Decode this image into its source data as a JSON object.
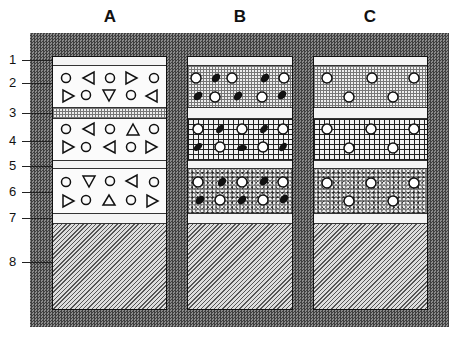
{
  "diagram": {
    "columns": [
      {
        "label": "A",
        "x": 52,
        "width": 115
      },
      {
        "label": "B",
        "x": 187,
        "width": 106
      },
      {
        "label": "C",
        "x": 313,
        "width": 115
      }
    ],
    "layer_labels": [
      "1",
      "2",
      "3",
      "4",
      "5",
      "6",
      "7",
      "8"
    ],
    "layers": [
      {
        "id": 1,
        "top": 0,
        "height": 9,
        "A": "plain",
        "B": "plain",
        "C": "plain"
      },
      {
        "id": 2,
        "top": 9,
        "height": 42,
        "A": "white",
        "B": "fine",
        "C": "fine"
      },
      {
        "id": 3,
        "top": 51,
        "height": 11,
        "A": "fine",
        "B": "plain",
        "C": "plain"
      },
      {
        "id": 4,
        "top": 62,
        "height": 42,
        "A": "white",
        "B": "grid",
        "C": "grid"
      },
      {
        "id": 5,
        "top": 104,
        "height": 8,
        "A": "plain",
        "B": "plain",
        "C": "plain"
      },
      {
        "id": 6,
        "top": 112,
        "height": 45,
        "A": "white",
        "B": "speckle",
        "C": "speckle"
      },
      {
        "id": 7,
        "top": 157,
        "height": 10,
        "A": "plain",
        "B": "plain",
        "C": "plain"
      },
      {
        "id": 8,
        "top": 167,
        "height": 87,
        "A": "hatch",
        "B": "hatch",
        "C": "hatch"
      }
    ],
    "symbol_legend": {
      "open-circle": "rounded grain",
      "triangle": "angular grain",
      "white-circle": "pore / bead",
      "black-blob": "dark inclusion"
    },
    "colors": {
      "frame": "#5e5e5e",
      "outline": "#111111",
      "light": "#f4f4f4"
    }
  }
}
